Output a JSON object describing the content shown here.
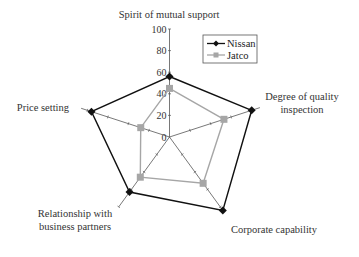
{
  "chart_data": {
    "type": "radar",
    "title": "",
    "categories": [
      "Spirit of mutual support",
      "Degree of quality inspection",
      "Corporate capability",
      "Relationship with business partners",
      "Price setting"
    ],
    "category_label_lines": [
      [
        "Spirit of mutual support"
      ],
      [
        "Degree of quality",
        "inspection"
      ],
      [
        "Corporate capability"
      ],
      [
        "Relationship with",
        "business partners"
      ],
      [
        "Price setting"
      ]
    ],
    "series": [
      {
        "name": "Nissan",
        "values": [
          56,
          80,
          84,
          63,
          76
        ],
        "color": "#111111",
        "marker": "diamond"
      },
      {
        "name": "Jatco",
        "values": [
          45,
          53,
          53,
          46,
          28
        ],
        "color": "#a6a6a6",
        "marker": "square"
      }
    ],
    "radial_ticks": [
      "0",
      "20",
      "40",
      "60",
      "80",
      "100"
    ],
    "rlim": [
      0,
      100
    ],
    "grid": false,
    "legend_position": "upper right"
  },
  "legend": {
    "items": [
      {
        "label": "Nissan"
      },
      {
        "label": "Jatco"
      }
    ]
  }
}
